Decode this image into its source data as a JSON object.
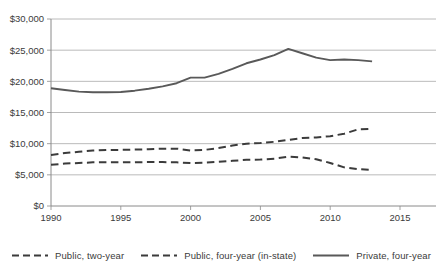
{
  "chart_data": {
    "type": "line",
    "title": "",
    "subtitle": "",
    "xlabel": "",
    "ylabel": "",
    "xlim": [
      1990,
      2015
    ],
    "ylim": [
      0,
      30000
    ],
    "xticks": [
      1990,
      1995,
      2000,
      2005,
      2010,
      2015
    ],
    "xticklabels": [
      "1990",
      "1995",
      "2000",
      "2005",
      "2010",
      "2015"
    ],
    "yticks": [
      0,
      5000,
      10000,
      15000,
      20000,
      25000,
      30000
    ],
    "yticklabels": [
      "$0",
      "$5,000",
      "$10,000",
      "$15,000",
      "$20,000",
      "$25,000",
      "$30,000"
    ],
    "grid": true,
    "grid_axis": "y",
    "grid_color": "#a8a8a8",
    "legend_position": "bottom",
    "x": [
      1990,
      1991,
      1992,
      1993,
      1994,
      1995,
      1996,
      1997,
      1998,
      1999,
      2000,
      2001,
      2002,
      2003,
      2004,
      2005,
      2006,
      2007,
      2008,
      2009,
      2010,
      2011,
      2012,
      2013
    ],
    "series": [
      {
        "name": "Public, two-year",
        "style": "dashed",
        "color": "#3b3b3b",
        "values": [
          6600,
          6800,
          6900,
          7000,
          7000,
          7000,
          7000,
          7050,
          7050,
          7000,
          6900,
          6950,
          7100,
          7250,
          7400,
          7450,
          7600,
          7900,
          7800,
          7500,
          6900,
          6200,
          5900,
          5800
        ]
      },
      {
        "name": "Public, four-year (in-state)",
        "style": "dashed",
        "color": "#3b3b3b",
        "values": [
          8200,
          8500,
          8700,
          8900,
          9000,
          9000,
          9050,
          9100,
          9200,
          9200,
          8900,
          9000,
          9300,
          9700,
          10000,
          10100,
          10300,
          10600,
          10900,
          11000,
          11200,
          11600,
          12300,
          12400
        ]
      },
      {
        "name": "Private, four-year",
        "style": "solid",
        "color": "#595959",
        "values": [
          18900,
          18600,
          18350,
          18250,
          18250,
          18300,
          18500,
          18800,
          19200,
          19700,
          20600,
          20600,
          21200,
          22000,
          22900,
          23500,
          24200,
          25200,
          24500,
          23800,
          23400,
          23500,
          23400,
          23200
        ]
      }
    ]
  },
  "legend": {
    "items": [
      {
        "label": "Public, two-year",
        "style": "dashed"
      },
      {
        "label": "Public, four-year (in-state)",
        "style": "dashed"
      },
      {
        "label": "Private, four-year",
        "style": "solid"
      }
    ]
  }
}
